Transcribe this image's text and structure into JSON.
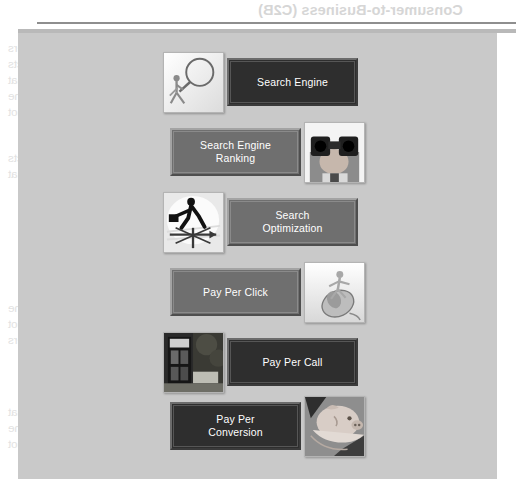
{
  "page": {
    "background_color": "#ffffff",
    "panel_color": "#c9c9c9",
    "rule_dark_color": "#8e8e8e",
    "rule_light_color": "#b9b9b9"
  },
  "ghost_text": {
    "note": "faint bleed-through text from the reverse side of the printed page, rendered mirrored",
    "heading_top": "Consumer-to-Business (C2B)",
    "heading_mid": "Business Models",
    "paragraph_lines": [
      "Consumer-to-Business (C2B) models give consumers",
      "the means of naming their own prices for products",
      "and services, or to bid on goods and services that",
      "businesses offer. Consumers set the terms of the",
      "transaction and businesses decide whether or not"
    ]
  },
  "diagram": {
    "button_colors": {
      "dark": "#2e2e2e",
      "mid": "#6f6f6f",
      "text": "#ffffff"
    },
    "rows": [
      {
        "label": "Search Engine",
        "label_lines": [
          "Search Engine"
        ],
        "button_style": "dark",
        "image_side": "left",
        "image_name": "magnifying-glass-figure-thumbnail",
        "image_alt": "Stick figure holding a large magnifying glass"
      },
      {
        "label": "Search Engine Ranking",
        "label_lines": [
          "Search Engine",
          "Ranking"
        ],
        "button_style": "mid",
        "image_side": "right",
        "image_name": "binoculars-thumbnail",
        "image_alt": "Person looking through binoculars"
      },
      {
        "label": "Search Optimization",
        "label_lines": [
          "Search",
          "Optimization"
        ],
        "button_style": "mid",
        "image_side": "left",
        "image_name": "weathervane-businessman-thumbnail",
        "image_alt": "Businessman with briefcase walking on a weather vane"
      },
      {
        "label": "Pay Per Click",
        "label_lines": [
          "Pay Per Click"
        ],
        "button_style": "mid",
        "image_side": "right",
        "image_name": "computer-mouse-figure-thumbnail",
        "image_alt": "Stick figure riding a computer mouse"
      },
      {
        "label": "Pay Per Call",
        "label_lines": [
          "Pay Per Call"
        ],
        "button_style": "dark",
        "image_side": "left",
        "image_name": "phone-booth-thumbnail",
        "image_alt": "Red telephone booth on a street"
      },
      {
        "label": "Pay Per Conversion",
        "label_lines": [
          "Pay Per",
          "Conversion"
        ],
        "button_style": "dark",
        "image_side": "right",
        "image_name": "piggy-bank-thumbnail",
        "image_alt": "Hands holding a piggy bank"
      }
    ]
  }
}
